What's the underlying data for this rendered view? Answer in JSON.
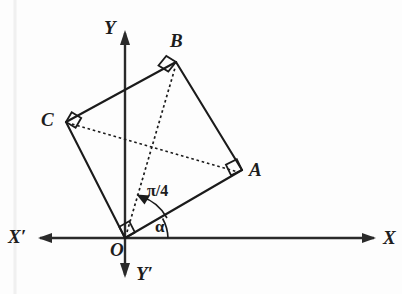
{
  "figure": {
    "background_color": "#fdfdfd",
    "line_color": "#1b1b1b",
    "axes": {
      "x_positive_label": "X",
      "x_negative_label": "X′",
      "y_positive_label": "Y",
      "y_negative_label": "Y′",
      "origin_label": "O",
      "x_axis": {
        "x1": 38,
        "y1": 238,
        "x2": 376,
        "y2": 238
      },
      "y_axis": {
        "x1": 125,
        "y1": 31,
        "x2": 125,
        "y2": 277
      },
      "origin": {
        "x": 125,
        "y": 238
      }
    },
    "vertices": [
      {
        "name": "O",
        "label": "O",
        "x": 125,
        "y": 238,
        "label_x": 112,
        "label_y": 242,
        "right_angle": true
      },
      {
        "name": "A",
        "label": "A",
        "x": 242,
        "y": 170,
        "label_x": 250,
        "label_y": 161,
        "right_angle": true
      },
      {
        "name": "B",
        "label": "B",
        "x": 176,
        "y": 62,
        "label_x": 172,
        "label_y": 32,
        "right_angle": true
      },
      {
        "name": "C",
        "label": "C",
        "x": 66,
        "y": 122,
        "label_x": 42,
        "label_y": 110,
        "right_angle": true
      }
    ],
    "edges": [
      {
        "name": "OA",
        "from": "O",
        "to": "A",
        "style": "solid"
      },
      {
        "name": "AB",
        "from": "A",
        "to": "B",
        "style": "solid"
      },
      {
        "name": "BC",
        "from": "B",
        "to": "C",
        "style": "solid"
      },
      {
        "name": "CO",
        "from": "C",
        "to": "O",
        "style": "solid"
      }
    ],
    "diagonals": [
      {
        "name": "OB",
        "from": "O",
        "to": "B",
        "style": "dashed"
      },
      {
        "name": "CA",
        "from": "C",
        "to": "A",
        "style": "dashed"
      }
    ],
    "angles": [
      {
        "name": "alpha",
        "label": "α",
        "label_x": 154,
        "label_y": 219,
        "between": [
          "x-axis",
          "OA"
        ],
        "vertex": "O",
        "value_deg": 30
      },
      {
        "name": "pi-over-4",
        "label": "π/4",
        "label_x": 147,
        "label_y": 183,
        "between": [
          "OA",
          "OB"
        ],
        "vertex": "O",
        "value_rad": "π/4"
      }
    ]
  }
}
